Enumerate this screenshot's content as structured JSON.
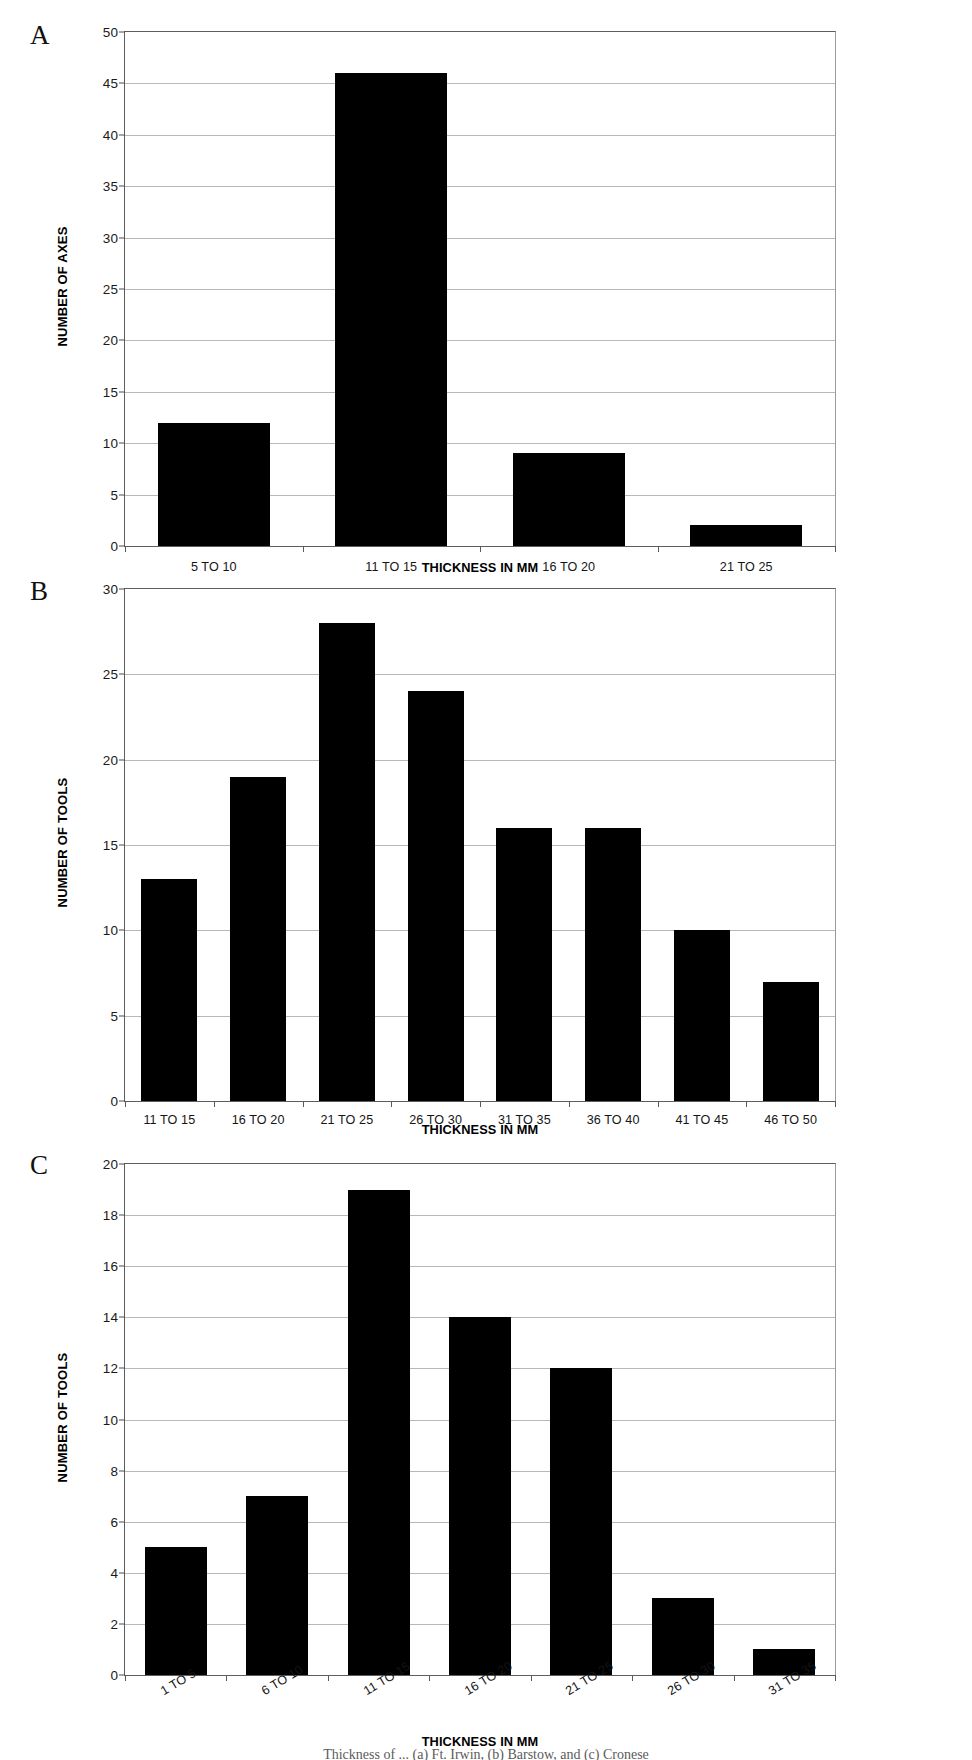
{
  "figure": {
    "caption": "Thickness of ... (a) Ft. Irwin, (b) Barstow, and (c) Cronese"
  },
  "panels": [
    {
      "letter": "A",
      "ylabel": "NUMBER OF AXES",
      "xlabel": "THICKNESS IN MM",
      "yticks": [
        "0",
        "5",
        "10",
        "15",
        "20",
        "25",
        "30",
        "35",
        "40",
        "45",
        "50"
      ],
      "xlabels": [
        "5 TO 10",
        "11 TO 15",
        "16 TO 20",
        "21 TO 25"
      ],
      "values": [
        12,
        46,
        9,
        2
      ]
    },
    {
      "letter": "B",
      "ylabel": "NUMBER OF TOOLS",
      "xlabel": "THICKNESS IN MM",
      "yticks": [
        "0",
        "5",
        "10",
        "15",
        "20",
        "25",
        "30"
      ],
      "xlabels": [
        "11 TO 15",
        "16 TO 20",
        "21 TO 25",
        "26 TO 30",
        "31 TO 35",
        "36 TO 40",
        "41 TO 45",
        "46 TO 50"
      ],
      "values": [
        13,
        19,
        28,
        24,
        16,
        16,
        10,
        7
      ]
    },
    {
      "letter": "C",
      "ylabel": "NUMBER OF TOOLS",
      "xlabel": "THICKNESS IN MM",
      "yticks": [
        "0",
        "2",
        "4",
        "6",
        "8",
        "10",
        "12",
        "14",
        "16",
        "18",
        "20"
      ],
      "xlabels": [
        "1 TO 5",
        "6 TO 10",
        "11 TO 15",
        "16 TO 20",
        "21 TO 25",
        "26 TO 30",
        "31 TO 35"
      ],
      "values": [
        5,
        7,
        19,
        14,
        12,
        3,
        1
      ]
    }
  ],
  "chart_data": [
    {
      "type": "bar",
      "panel": "A",
      "title": "",
      "categories": [
        "5 TO 10",
        "11 TO 15",
        "16 TO 20",
        "21 TO 25"
      ],
      "values": [
        12,
        46,
        9,
        2
      ],
      "xlabel": "THICKNESS IN MM",
      "ylabel": "NUMBER OF AXES",
      "ylim": [
        0,
        50
      ],
      "ytick_step": 5,
      "grid": true,
      "legend": "none",
      "bar_color": "#000000"
    },
    {
      "type": "bar",
      "panel": "B",
      "title": "",
      "categories": [
        "11 TO 15",
        "16 TO 20",
        "21 TO 25",
        "26 TO 30",
        "31 TO 35",
        "36 TO 40",
        "41 TO 45",
        "46 TO 50"
      ],
      "values": [
        13,
        19,
        28,
        24,
        16,
        16,
        10,
        7
      ],
      "xlabel": "THICKNESS IN MM",
      "ylabel": "NUMBER OF TOOLS",
      "ylim": [
        0,
        30
      ],
      "ytick_step": 5,
      "grid": true,
      "legend": "none",
      "bar_color": "#000000"
    },
    {
      "type": "bar",
      "panel": "C",
      "title": "",
      "categories": [
        "1 TO 5",
        "6 TO 10",
        "11 TO 15",
        "16 TO 20",
        "21 TO 25",
        "26 TO 30",
        "31 TO 35"
      ],
      "values": [
        5,
        7,
        19,
        14,
        12,
        3,
        1
      ],
      "xlabel": "THICKNESS IN MM",
      "ylabel": "NUMBER OF TOOLS",
      "ylim": [
        0,
        20
      ],
      "ytick_step": 2,
      "grid": true,
      "legend": "none",
      "bar_color": "#000000"
    }
  ]
}
